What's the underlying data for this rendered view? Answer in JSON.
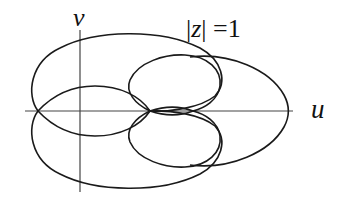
{
  "figure": {
    "labels": {
      "v_axis": "v",
      "u_axis": "u",
      "contour_bar_left": "|",
      "contour_var": "z",
      "contour_rest": "| =1"
    },
    "colors": {
      "stroke": "#1a1a1a",
      "axis": "#333333",
      "background": "#ffffff"
    }
  }
}
